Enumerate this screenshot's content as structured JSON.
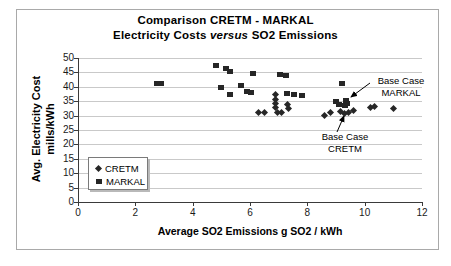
{
  "title": {
    "line1": "Comparison CRETM - MARKAL",
    "line2_pre": "Electricity Costs ",
    "line2_italic": "versus",
    "line2_post": " SO2 Emissions"
  },
  "legend": {
    "items": [
      {
        "label": "CRETM",
        "marker": "diamond"
      },
      {
        "label": "MARKAL",
        "marker": "square"
      }
    ]
  },
  "annotations": {
    "markal": {
      "line1": "Base Case",
      "line2": "MARKAL",
      "target_x": 9.4,
      "target_y": 35
    },
    "cretm": {
      "label": "Base Case CRETM",
      "target_x": 9.35,
      "target_y": 31
    }
  },
  "colors": {
    "marker": "#262626",
    "gridline": "#c9c9c9",
    "axis": "#3a3a3a",
    "frame": "#a9a9a9",
    "background": "#ffffff"
  },
  "chart_data": {
    "type": "scatter",
    "title": "Comparison CRETM - MARKAL",
    "subtitle": "Electricity Costs versus SO2 Emissions",
    "xlabel": "Average SO2 Emissions g SO2 / kWh",
    "ylabel": "Avg. Electricity Cost mills/kWh",
    "ylabel_line1": "Avg. Electricity Cost",
    "ylabel_line2": "mills/kWh",
    "xlim": [
      0,
      12
    ],
    "ylim": [
      0,
      50
    ],
    "xticks": [
      0,
      2,
      4,
      6,
      8,
      10,
      12
    ],
    "yticks": [
      0,
      5,
      10,
      15,
      20,
      25,
      30,
      35,
      40,
      45,
      50
    ],
    "grid": "horizontal",
    "legend_position": "inside-lower-left",
    "series": [
      {
        "name": "CRETM",
        "marker": "diamond",
        "points": [
          [
            6.3,
            31
          ],
          [
            6.5,
            31
          ],
          [
            6.9,
            37.2
          ],
          [
            6.9,
            35.6
          ],
          [
            6.88,
            34.1
          ],
          [
            6.9,
            32.7
          ],
          [
            6.95,
            31.2
          ],
          [
            7.1,
            31.2
          ],
          [
            7.3,
            33.8
          ],
          [
            7.35,
            32.6
          ],
          [
            8.6,
            30
          ],
          [
            8.8,
            31.1
          ],
          [
            9.15,
            31.5
          ],
          [
            9.3,
            30.6
          ],
          [
            9.45,
            31
          ],
          [
            9.6,
            31.8
          ],
          [
            10.2,
            32.8
          ],
          [
            10.35,
            33
          ],
          [
            11,
            32.5
          ]
        ]
      },
      {
        "name": "MARKAL",
        "marker": "square",
        "points": [
          [
            2.75,
            41
          ],
          [
            2.9,
            41
          ],
          [
            4.8,
            47.3
          ],
          [
            5.15,
            46.2
          ],
          [
            5.3,
            45.2
          ],
          [
            6.1,
            44.7
          ],
          [
            7.05,
            44.3
          ],
          [
            7.25,
            44
          ],
          [
            5.0,
            39.8
          ],
          [
            5.7,
            40.3
          ],
          [
            5.3,
            37.5
          ],
          [
            5.9,
            38.2
          ],
          [
            6.05,
            38
          ],
          [
            7.3,
            37.8
          ],
          [
            7.55,
            37.5
          ],
          [
            7.8,
            37
          ],
          [
            9.2,
            41
          ],
          [
            9.0,
            34.8
          ],
          [
            9.1,
            33.8
          ],
          [
            9.35,
            35.3
          ],
          [
            9.4,
            34.3
          ],
          [
            9.3,
            33.5
          ]
        ]
      }
    ]
  }
}
